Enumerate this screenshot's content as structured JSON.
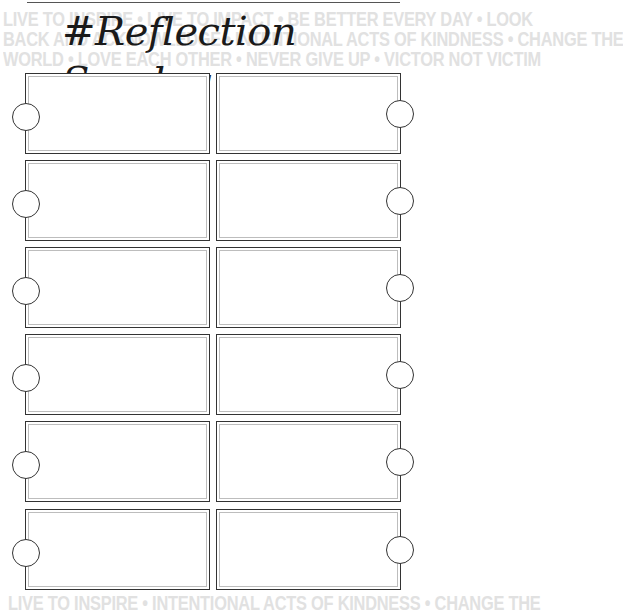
{
  "header": {
    "title": "#Reflection Sunday"
  },
  "background_quotes": {
    "line1": "LIVE TO INSPIRE • LIVE TO IMPACT • BE BETTER EVERY DAY • LOOK",
    "line2": "BACK AND ACKNOWLEDGE • INTENTIONAL ACTS OF KINDNESS • CHANGE THE",
    "line3": "WORLD • LOVE EACH OTHER • NEVER GIVE UP • VICTOR NOT VICTIM",
    "line4": "LIVE TO INSPIRE • INTENTIONAL ACTS OF KINDNESS • CHANGE THE"
  },
  "grid": {
    "rows": 6,
    "columns": 2,
    "boxes": [
      {
        "row": 1,
        "col": "left",
        "text": ""
      },
      {
        "row": 1,
        "col": "right",
        "text": ""
      },
      {
        "row": 2,
        "col": "left",
        "text": ""
      },
      {
        "row": 2,
        "col": "right",
        "text": ""
      },
      {
        "row": 3,
        "col": "left",
        "text": ""
      },
      {
        "row": 3,
        "col": "right",
        "text": ""
      },
      {
        "row": 4,
        "col": "left",
        "text": ""
      },
      {
        "row": 4,
        "col": "right",
        "text": ""
      },
      {
        "row": 5,
        "col": "left",
        "text": ""
      },
      {
        "row": 5,
        "col": "right",
        "text": ""
      },
      {
        "row": 6,
        "col": "left",
        "text": ""
      },
      {
        "row": 6,
        "col": "right",
        "text": ""
      }
    ]
  },
  "colors": {
    "ink": "#333333",
    "inner_border": "#bdbdbd",
    "background_text": "#e1e1e1"
  }
}
